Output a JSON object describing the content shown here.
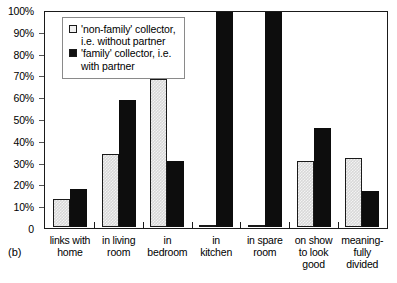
{
  "panel_label": "(b)",
  "legend": {
    "items": [
      {
        "swatch": "light",
        "label": "'non-family' collector,\ni.e. without partner"
      },
      {
        "swatch": "dark",
        "label": "'family' collector, i.e.\nwith partner"
      }
    ]
  },
  "axis": {
    "y_ticks": [
      "100%",
      "90%",
      "80%",
      "70%",
      "60%",
      "50%",
      "40%",
      "30%",
      "20%",
      "10%",
      "0"
    ]
  },
  "chart_data": {
    "type": "bar",
    "title": "",
    "subtitle": "",
    "xlabel": "",
    "ylabel": "",
    "ylim": [
      0,
      100
    ],
    "grid": false,
    "legend_position": "top-left-inside",
    "categories": [
      "links with\nhome",
      "in living\nroom",
      "in\nbedroom",
      "in\nkitchen",
      "in spare\nroom",
      "on show\nto look\ngood",
      "meaning-\nfully\ndivided"
    ],
    "series": [
      {
        "name": "'non-family' collector, i.e. without partner",
        "style": "light",
        "values": [
          13,
          34,
          69,
          1,
          1,
          31,
          32
        ]
      },
      {
        "name": "'family' collector, i.e. with partner",
        "style": "dark",
        "values": [
          18,
          59,
          31,
          100,
          100,
          46,
          17
        ]
      }
    ]
  }
}
